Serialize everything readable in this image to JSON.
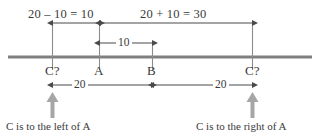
{
  "figure": {
    "colors": {
      "axis_line": "#808080",
      "dimension_line": "#4a4a4a",
      "tick_line": "#8c8c8c",
      "text": "#3a3a3a",
      "pointer_arrow": "#a6a6a6",
      "background": "#ffffff"
    },
    "top_labels": {
      "left_equation": "20 – 10 = 10",
      "right_equation": "20 + 10 = 30"
    },
    "middle_label": {
      "ab_distance": "10"
    },
    "point_labels": {
      "c_left": "C?",
      "a": "A",
      "b": "B",
      "c_right": "C?"
    },
    "bottom_dimensions": {
      "left_span": "20",
      "right_span": "20"
    },
    "captions": {
      "left": "C is to the left of A",
      "right": "C is to the right of A"
    },
    "geometry": {
      "axis_y": 57,
      "axis_x_start": 8,
      "axis_x_end": 312,
      "tick_c_left": 52,
      "tick_a": 99,
      "tick_b": 152,
      "tick_c_right": 252,
      "top_arrow_y": 23,
      "mid_arrow_y": 43,
      "dim_arrow_y": 85
    }
  }
}
